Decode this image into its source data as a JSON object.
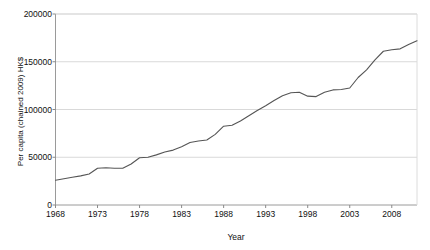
{
  "chart_data": {
    "type": "line",
    "title": "",
    "xlabel": "Year",
    "ylabel": "Per capita (chained 2009) HK$",
    "xlim": [
      1968,
      2011
    ],
    "ylim": [
      0,
      200000
    ],
    "ytick_labels": [
      "0",
      "50000",
      "100000",
      "150000",
      "200000"
    ],
    "ytick_values": [
      0,
      50000,
      100000,
      150000,
      200000
    ],
    "xtick_labels": [
      "1968",
      "1973",
      "1978",
      "1983",
      "1988",
      "1993",
      "1998",
      "2003",
      "2008"
    ],
    "xtick_values": [
      1968,
      1973,
      1978,
      1983,
      1988,
      1993,
      1998,
      2003,
      2008
    ],
    "grid": "horizontal",
    "legend": "none",
    "line_color": "#555555",
    "grid_color": "#d9d9d9",
    "axis_color": "#a8a8a8",
    "series": [
      {
        "name": "Per capita GDP (chained 2009) HK$",
        "x": [
          1968,
          1969,
          1970,
          1971,
          1972,
          1973,
          1974,
          1975,
          1976,
          1977,
          1978,
          1979,
          1980,
          1981,
          1982,
          1983,
          1984,
          1985,
          1986,
          1987,
          1988,
          1989,
          1990,
          1991,
          1992,
          1993,
          1994,
          1995,
          1996,
          1997,
          1998,
          1999,
          2000,
          2001,
          2002,
          2003,
          2004,
          2005,
          2006,
          2007,
          2008,
          2009,
          2010,
          2011
        ],
        "values": [
          26000,
          27500,
          29000,
          30500,
          32500,
          38500,
          39000,
          38500,
          38500,
          43000,
          49500,
          50000,
          52500,
          55500,
          57500,
          61000,
          65500,
          67000,
          68000,
          74000,
          82500,
          83500,
          88000,
          93500,
          99000,
          104000,
          109500,
          114500,
          117500,
          118000,
          114000,
          113500,
          118000,
          120500,
          121000,
          122500,
          133500,
          141500,
          152000,
          161000,
          162500,
          163500,
          168000,
          172000
        ]
      }
    ]
  },
  "axes": {
    "xlabel": "Year",
    "ylabel": "Per capita (chained 2009) HK$"
  }
}
